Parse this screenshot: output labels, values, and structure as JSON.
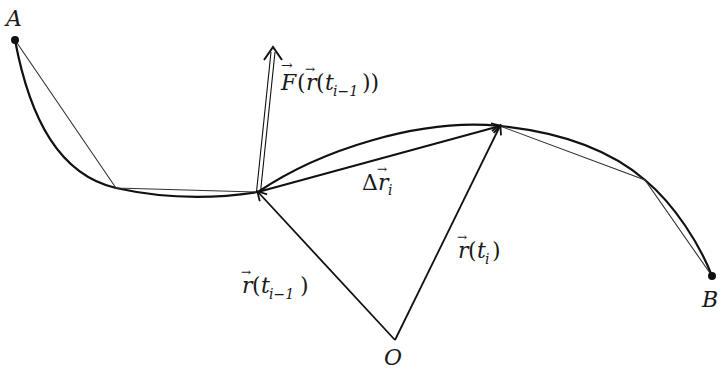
{
  "diagram": {
    "type": "line-integral-path-approximation",
    "points": {
      "A": {
        "label": "A",
        "x": 15,
        "y": 40
      },
      "P1": {
        "x": 116,
        "y": 188
      },
      "P_prev": {
        "x": 258,
        "y": 192
      },
      "P_curr": {
        "x": 500,
        "y": 126
      },
      "P4": {
        "x": 645,
        "y": 180
      },
      "B": {
        "label": "B",
        "x": 712,
        "y": 276
      },
      "O": {
        "label": "O",
        "x": 395,
        "y": 340
      }
    },
    "labels": {
      "A": "A",
      "B": "B",
      "O": "O",
      "force": {
        "main": "F",
        "open": "(",
        "r": "r",
        "open2": "(",
        "t": "t",
        "sub": "i−1",
        "close": "))"
      },
      "delta_r": {
        "delta": "Δ",
        "r": "r",
        "sub": "i"
      },
      "r_prev": {
        "r": "r",
        "open": "(",
        "t": "t",
        "sub": "i−1",
        "close": ")"
      },
      "r_curr": {
        "r": "r",
        "open": "(",
        "t": "t",
        "sub": "i",
        "close": ")"
      }
    },
    "colors": {
      "stroke": "#111111",
      "chord": "#333333",
      "background": "#ffffff"
    }
  }
}
